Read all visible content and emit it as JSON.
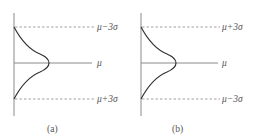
{
  "colors": {
    "axis": "#8a8a8a",
    "curve": "#333333",
    "dashed": "#888888",
    "text": "#555555"
  },
  "panels": [
    {
      "caption": "(a)",
      "top_label": "μ−3σ",
      "mid_label": "μ",
      "bottom_label": "μ+3σ"
    },
    {
      "caption": "(b)",
      "top_label": "μ+3σ",
      "mid_label": "μ",
      "bottom_label": "μ−3σ"
    }
  ]
}
